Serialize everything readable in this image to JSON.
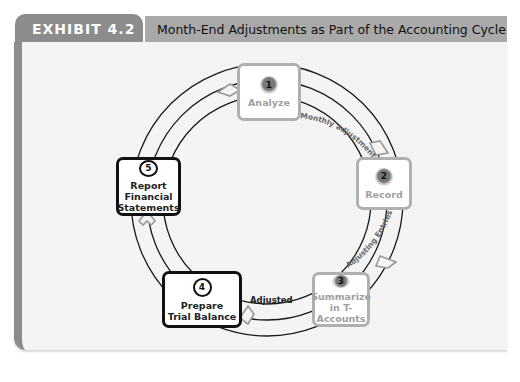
{
  "header": {
    "exhibit_label": "EXHIBIT 4.2",
    "title": "Month-End Adjustments as Part of the Accounting Cycle"
  },
  "colors": {
    "tab": "#8c8c8c",
    "title_bar": "#a9a9a9",
    "panel": "#f4f4f4",
    "inactive_border": "#b0b0b0",
    "active_border": "#111111"
  },
  "steps": [
    {
      "number": "1",
      "label_lines": [
        "Analyze"
      ],
      "state": "inactive"
    },
    {
      "number": "2",
      "label_lines": [
        "Record"
      ],
      "state": "inactive"
    },
    {
      "number": "3",
      "label_lines": [
        "Summarize",
        "in T-Accounts"
      ],
      "state": "inactive"
    },
    {
      "number": "4",
      "label_lines": [
        "Prepare",
        "Trial Balance"
      ],
      "state": "active"
    },
    {
      "number": "5",
      "label_lines": [
        "Report",
        "Financial",
        "Statements"
      ],
      "state": "active"
    }
  ],
  "arc_labels": {
    "analyze_to_record": "Monthly adjustments",
    "record_to_summarize": "Adjusting Entries",
    "summarize_to_prepare": "Adjusted"
  }
}
